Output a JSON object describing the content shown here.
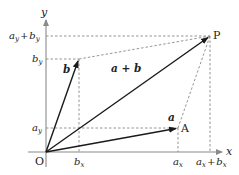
{
  "diagram": {
    "title": "",
    "type": "vector addition (parallelogram rule)",
    "colors": {
      "axis": "#8a8a8a",
      "vector": "#1a1a1a",
      "dashed": "#7a7a7a",
      "text": "#222222",
      "background": "#ffffff"
    },
    "axes": {
      "x_label": "x",
      "y_label": "y",
      "origin_label": "O"
    },
    "points": {
      "origin": {
        "label": "O"
      },
      "A": {
        "label": "A"
      },
      "P": {
        "label": "P"
      }
    },
    "vectors": [
      {
        "id": "a",
        "label": "a",
        "from": "O",
        "to": "A"
      },
      {
        "id": "b",
        "label": "b",
        "from": "O",
        "to": "B"
      },
      {
        "id": "a_plus_b",
        "label": "a + b",
        "from": "O",
        "to": "P"
      }
    ],
    "x_ticks": [
      {
        "label_main": "b",
        "label_sub": "x"
      },
      {
        "label_main": "a",
        "label_sub": "x"
      },
      {
        "label_main": "a",
        "label_sub": "x",
        "plus": "+",
        "label_main2": "b",
        "label_sub2": "x"
      }
    ],
    "y_ticks": [
      {
        "label_main": "a",
        "label_sub": "y",
        "plus": "+",
        "label_main2": "b",
        "label_sub2": "y"
      },
      {
        "label_main": "b",
        "label_sub": "y"
      },
      {
        "label_main": "a",
        "label_sub": "y"
      }
    ]
  }
}
